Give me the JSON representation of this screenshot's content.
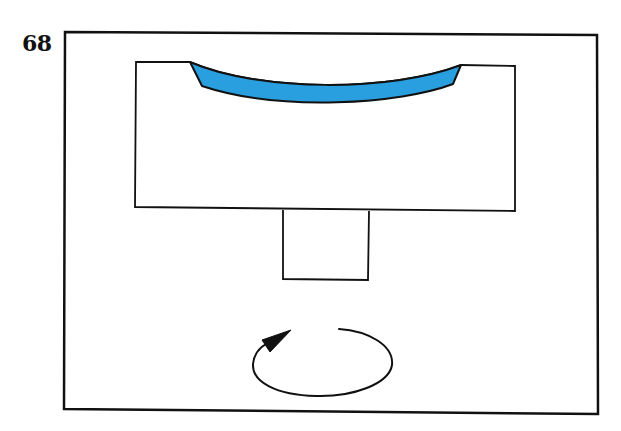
{
  "figure": {
    "number": "68"
  },
  "diagram": {
    "colors": {
      "stroke": "#111111",
      "background": "#ffffff",
      "layer_fill": "#2a9fe0"
    },
    "elements": [
      {
        "id": "outer-frame",
        "shape": "rectangle"
      },
      {
        "id": "holder-block",
        "shape": "rectangle-with-concave-top"
      },
      {
        "id": "blue-layer",
        "shape": "curved-meniscus",
        "color": "#2a9fe0"
      },
      {
        "id": "shaft",
        "shape": "rectangle"
      },
      {
        "id": "rotation-arrow",
        "shape": "ellipse-arrow",
        "direction": "counterclockwise"
      }
    ]
  }
}
